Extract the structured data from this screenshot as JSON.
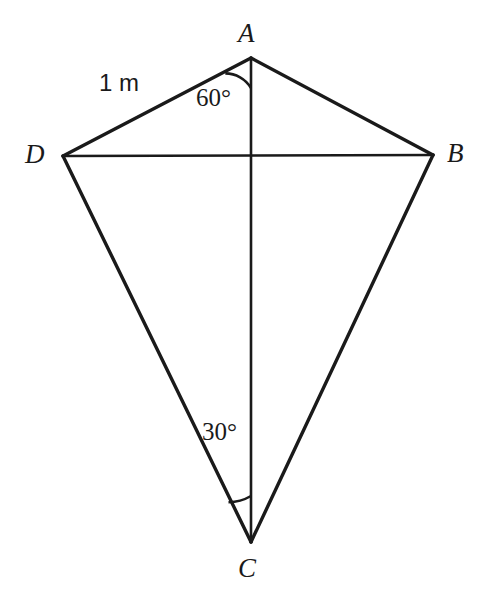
{
  "figure": {
    "background_color": "#ffffff",
    "stroke_color": "#1a1a1a",
    "vertices": [
      {
        "name": "A",
        "label": "A",
        "x": 251,
        "y": 58
      },
      {
        "name": "B",
        "label": "B",
        "x": 433,
        "y": 155
      },
      {
        "name": "C",
        "label": "C",
        "x": 251,
        "y": 542
      },
      {
        "name": "D",
        "label": "D",
        "x": 63,
        "y": 156
      }
    ],
    "edges": [
      {
        "name": "AD",
        "from": "A",
        "to": "D",
        "width": 3.4
      },
      {
        "name": "AB",
        "from": "A",
        "to": "B",
        "width": 3.4
      },
      {
        "name": "DC",
        "from": "D",
        "to": "C",
        "width": 3.4
      },
      {
        "name": "BC",
        "from": "B",
        "to": "C",
        "width": 3.4
      }
    ],
    "diagonals": [
      {
        "name": "DB",
        "from": "D",
        "to": "B",
        "width": 2.6
      },
      {
        "name": "AC",
        "from": "A",
        "to": "C",
        "width": 2.6
      }
    ],
    "angles": [
      {
        "name": "angle-DAC",
        "vertex": "A",
        "label": "60°",
        "value": 60,
        "unit": "degrees",
        "arc_radius": 30
      },
      {
        "name": "angle-DCA",
        "vertex": "C",
        "label": "30°",
        "value": 30,
        "unit": "degrees",
        "arc_radius": 46
      }
    ],
    "measurements": [
      {
        "name": "side-AD-length",
        "label": "1 m",
        "value": 1,
        "unit": "m",
        "applies_to": "AD"
      }
    ]
  }
}
